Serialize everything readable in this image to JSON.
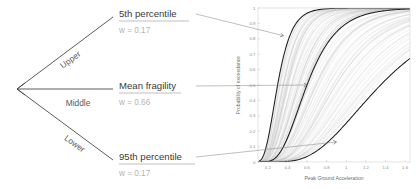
{
  "diagram": {
    "branches": [
      {
        "id": "upper",
        "branch_label": "Upper",
        "title": "5th percentile",
        "weight_label": "w = 0.17"
      },
      {
        "id": "middle",
        "branch_label": "Middle",
        "title": "Mean fragility",
        "weight_label": "w = 0.66"
      },
      {
        "id": "lower",
        "branch_label": "Lower",
        "title": "95th percentile",
        "weight_label": "w = 0.17"
      }
    ]
  },
  "chart_data": {
    "type": "line",
    "title": "",
    "xlabel": "Peak Ground Acceleration",
    "ylabel": "Probability of exceedance",
    "xlim": [
      0.1,
      1.65
    ],
    "ylim": [
      0,
      1
    ],
    "grid": false,
    "legend": null,
    "xticks": [
      "0.2",
      "0.4",
      "0.6",
      "0.8",
      "1",
      "1.2",
      "1.4",
      "1.6"
    ],
    "xtick_values": [
      0.2,
      0.4,
      0.6,
      0.8,
      1.0,
      1.2,
      1.4,
      1.6
    ],
    "yticks": [
      "0",
      "0.1",
      "0.2",
      "0.3",
      "0.4",
      "0.5",
      "0.6",
      "0.7",
      "0.8",
      "0.9",
      "1"
    ],
    "ytick_values": [
      0,
      0.1,
      0.2,
      0.3,
      0.4,
      0.5,
      0.6,
      0.7,
      0.8,
      0.9,
      1
    ],
    "x": [
      0.1,
      0.15,
      0.2,
      0.25,
      0.3,
      0.35,
      0.4,
      0.45,
      0.5,
      0.55,
      0.6,
      0.65,
      0.7,
      0.75,
      0.8,
      0.85,
      0.9,
      0.95,
      1.0,
      1.1,
      1.2,
      1.3,
      1.4,
      1.5,
      1.6
    ],
    "series": [
      {
        "name": "5th percentile (upper bound fragility)",
        "role": "highlight",
        "median_pga": 0.3,
        "beta": 0.38,
        "marker_point": [
          0.36,
          0.82
        ],
        "values": [
          0.011,
          0.094,
          0.243,
          0.409,
          0.552,
          0.664,
          0.748,
          0.81,
          0.856,
          0.89,
          0.916,
          0.935,
          0.95,
          0.961,
          0.969,
          0.976,
          0.981,
          0.985,
          0.988,
          0.993,
          0.995,
          0.997,
          0.998,
          0.999,
          0.999
        ]
      },
      {
        "name": "Mean fragility",
        "role": "highlight",
        "median_pga": 0.6,
        "beta": 0.4,
        "marker_point": [
          0.6,
          0.5
        ],
        "values": [
          0.0,
          0.0,
          0.003,
          0.018,
          0.055,
          0.114,
          0.191,
          0.275,
          0.36,
          0.441,
          0.5,
          0.571,
          0.63,
          0.683,
          0.728,
          0.767,
          0.8,
          0.829,
          0.853,
          0.891,
          0.919,
          0.939,
          0.954,
          0.965,
          0.973
        ]
      },
      {
        "name": "95th percentile (lower bound fragility)",
        "role": "highlight",
        "median_pga": 1.35,
        "beta": 0.45,
        "marker_point": [
          0.9,
          0.13
        ],
        "values": [
          0.0,
          0.0,
          0.0,
          0.0,
          0.001,
          0.003,
          0.008,
          0.016,
          0.028,
          0.045,
          0.066,
          0.091,
          0.119,
          0.15,
          0.183,
          0.217,
          0.252,
          0.287,
          0.322,
          0.39,
          0.452,
          0.508,
          0.558,
          0.602,
          0.64
        ]
      }
    ],
    "background_series_count": 120,
    "background_description": "dense grey bundle of simulated fragility curves spanning the range between the highlighted percentile curves"
  }
}
